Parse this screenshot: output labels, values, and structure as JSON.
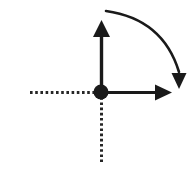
{
  "figure": {
    "canvas": {
      "width": 193,
      "height": 172,
      "background": "#ffffff"
    },
    "ink_color": "#1a1a1a",
    "dot_color": "#1a1a1a",
    "origin": {
      "x": 101,
      "y": 92,
      "radius": 7.5,
      "label": "origin-point"
    },
    "vertical_vector": {
      "label": "vertical-axis-vector",
      "from": {
        "x": 101.5,
        "y": 92
      },
      "to": {
        "x": 101.5,
        "y": 20
      },
      "shaft_width": 3.4,
      "head_length": 17,
      "head_width": 17,
      "direction": "up"
    },
    "horizontal_vector": {
      "label": "horizontal-axis-vector",
      "from": {
        "x": 101,
        "y": 92.5
      },
      "to": {
        "x": 172,
        "y": 92.5
      },
      "shaft_width": 3.2,
      "head_length": 17,
      "head_width": 16,
      "direction": "right"
    },
    "dotted_left": {
      "label": "negative-x-dotted-line",
      "from": {
        "x": 30,
        "y": 92.5
      },
      "to": {
        "x": 101,
        "y": 92.5
      },
      "width": 3,
      "dash": "2.6 2.6"
    },
    "dotted_down": {
      "label": "negative-y-dotted-line",
      "from": {
        "x": 101.5,
        "y": 92
      },
      "to": {
        "x": 101.5,
        "y": 162
      },
      "width": 3,
      "dash": "2.6 2.6"
    },
    "rotation_arc": {
      "label": "clockwise-rotation-arc",
      "start": {
        "x": 106,
        "y": 11
      },
      "control": {
        "x": 163,
        "y": 19
      },
      "end": {
        "x": 179,
        "y": 72
      },
      "stroke_width": 2.6,
      "head_length": 16,
      "head_width": 15,
      "head_tip": {
        "x": 179,
        "y": 89
      },
      "direction": "clockwise"
    }
  }
}
